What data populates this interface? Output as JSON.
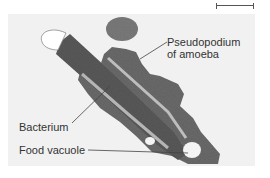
{
  "figure": {
    "scale_bar": {
      "label": ""
    },
    "labels": {
      "pseudopodium_line1": "Pseudopodium",
      "pseudopodium_line2": "of amoeba",
      "bacterium": "Bacterium",
      "food_vacuole": "Food vacuole"
    },
    "colors": {
      "background": "#f2f2f2",
      "cell_dark": "#5a5a5a",
      "cell_mid": "#7c7c7c",
      "label_text": "#333333",
      "leader_line": "#444444"
    }
  }
}
